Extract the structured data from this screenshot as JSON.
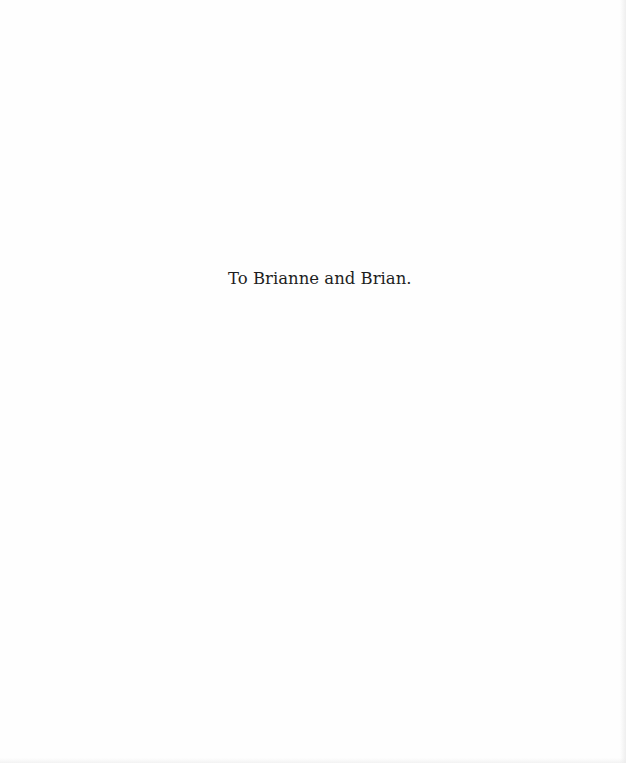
{
  "document": {
    "type": "dedication-page",
    "dedication_text": "To Brianne and Brian."
  }
}
